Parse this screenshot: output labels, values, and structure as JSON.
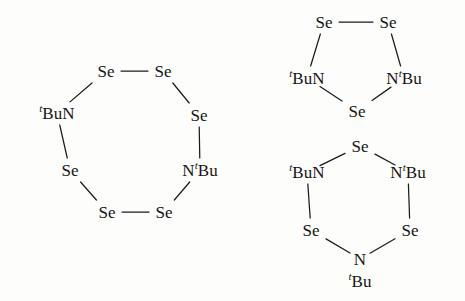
{
  "figure": {
    "background_color": "#fdfdfc",
    "ink_color": "#1c1c1c",
    "width": 465,
    "height": 301
  },
  "labels": {
    "Se": "Se",
    "N": "N",
    "tBuN": "BuN",
    "NtBu": "N",
    "Bu": "Bu",
    "tbu_prefix": "t",
    "tbu_suffix": "Bu"
  },
  "structures": [
    {
      "id": "eight-membered-ring",
      "name": "1,5-di-tert-butyl-1,5-diaza-cyclooctaselenane",
      "ring_size": 8,
      "vertices": [
        {
          "id": "se1",
          "label": "Se",
          "kind": "Se",
          "x": 106,
          "y": 71
        },
        {
          "id": "se2",
          "label": "Se",
          "kind": "Se",
          "x": 163,
          "y": 71
        },
        {
          "id": "se3",
          "label": "Se",
          "kind": "Se",
          "x": 199,
          "y": 115
        },
        {
          "id": "n1",
          "label": "N",
          "kind": "NtBu",
          "x": 200,
          "y": 170,
          "tbu_side": "right"
        },
        {
          "id": "se4",
          "label": "Se",
          "kind": "Se",
          "x": 164,
          "y": 212
        },
        {
          "id": "se5",
          "label": "Se",
          "kind": "Se",
          "x": 107,
          "y": 212
        },
        {
          "id": "se6",
          "label": "Se",
          "kind": "Se",
          "x": 70,
          "y": 170
        },
        {
          "id": "n2",
          "label": "N",
          "kind": "tBuN",
          "x": 57,
          "y": 113,
          "tbu_side": "left"
        }
      ],
      "bonds": [
        {
          "from": "se1",
          "to": "se2",
          "type": "horizontal"
        },
        {
          "from": "se2",
          "to": "se3",
          "type": "diagonal"
        },
        {
          "from": "se3",
          "to": "n1",
          "type": "vertical"
        },
        {
          "from": "n1",
          "to": "se4",
          "type": "diagonal"
        },
        {
          "from": "se4",
          "to": "se5",
          "type": "horizontal"
        },
        {
          "from": "se5",
          "to": "se6",
          "type": "diagonal"
        },
        {
          "from": "se6",
          "to": "n2",
          "type": "vertical"
        },
        {
          "from": "n2",
          "to": "se1",
          "type": "diagonal"
        }
      ]
    },
    {
      "id": "five-membered-ring",
      "name": "1,3-di-tert-butyl-1,3-diaza-triselenolane",
      "ring_size": 5,
      "vertices": [
        {
          "id": "se1",
          "label": "Se",
          "kind": "Se",
          "x": 324,
          "y": 22
        },
        {
          "id": "se2",
          "label": "Se",
          "kind": "Se",
          "x": 388,
          "y": 22
        },
        {
          "id": "n1",
          "label": "N",
          "kind": "NtBu",
          "x": 404,
          "y": 78,
          "tbu_side": "right"
        },
        {
          "id": "se3",
          "label": "Se",
          "kind": "Se",
          "x": 357,
          "y": 111
        },
        {
          "id": "n2",
          "label": "N",
          "kind": "tBuN",
          "x": 307,
          "y": 78,
          "tbu_side": "left"
        }
      ],
      "bonds": [
        {
          "from": "se1",
          "to": "se2",
          "type": "horizontal"
        },
        {
          "from": "se2",
          "to": "n1",
          "type": "diagonal"
        },
        {
          "from": "n1",
          "to": "se3",
          "type": "diagonal"
        },
        {
          "from": "se3",
          "to": "n2",
          "type": "diagonal"
        },
        {
          "from": "n2",
          "to": "se1",
          "type": "diagonal"
        }
      ]
    },
    {
      "id": "six-membered-ring",
      "name": "1,3,5-tri-tert-butyl-1,3,5-triaza-triselenane",
      "ring_size": 6,
      "vertices": [
        {
          "id": "se1",
          "label": "Se",
          "kind": "Se",
          "x": 360,
          "y": 146
        },
        {
          "id": "n1",
          "label": "N",
          "kind": "NtBu",
          "x": 408,
          "y": 172,
          "tbu_side": "right"
        },
        {
          "id": "se2",
          "label": "Se",
          "kind": "Se",
          "x": 410,
          "y": 230
        },
        {
          "id": "n2",
          "label": "N",
          "kind": "NbelowBu",
          "x": 360,
          "y": 259,
          "tbu_side": "below"
        },
        {
          "id": "se3",
          "label": "Se",
          "kind": "Se",
          "x": 311,
          "y": 230
        },
        {
          "id": "n3",
          "label": "N",
          "kind": "tBuN",
          "x": 307,
          "y": 172,
          "tbu_side": "left"
        }
      ],
      "bonds": [
        {
          "from": "se1",
          "to": "n1",
          "type": "diagonal"
        },
        {
          "from": "n1",
          "to": "se2",
          "type": "vertical"
        },
        {
          "from": "se2",
          "to": "n2",
          "type": "diagonal"
        },
        {
          "from": "n2",
          "to": "se3",
          "type": "diagonal"
        },
        {
          "from": "se3",
          "to": "n3",
          "type": "vertical"
        },
        {
          "from": "n3",
          "to": "se1",
          "type": "diagonal"
        }
      ]
    }
  ]
}
